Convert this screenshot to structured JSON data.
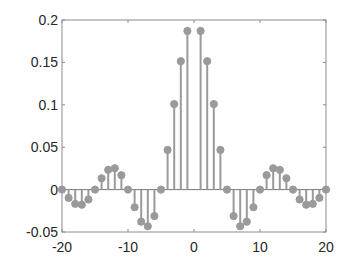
{
  "chart_data": {
    "type": "stem",
    "title": "",
    "xlabel": "",
    "ylabel": "",
    "xlim": [
      -20,
      20
    ],
    "ylim": [
      -0.05,
      0.2
    ],
    "xticks": [
      -20,
      -10,
      0,
      10,
      20
    ],
    "xtick_labels": [
      "-20",
      "-10",
      "0",
      "10",
      "20"
    ],
    "yticks": [
      -0.05,
      0,
      0.05,
      0.1,
      0.15,
      0.2
    ],
    "ytick_labels": [
      "-0.05",
      "0",
      "0.05",
      "0.1",
      "0.15",
      "0.2"
    ],
    "grid": false,
    "legend": null,
    "x": [
      -20,
      -19,
      -18,
      -17,
      -16,
      -15,
      -14,
      -13,
      -12,
      -11,
      -10,
      -9,
      -8,
      -7,
      -6,
      -5,
      -4,
      -3,
      -2,
      -1,
      1,
      2,
      3,
      4,
      5,
      6,
      7,
      8,
      9,
      10,
      11,
      12,
      13,
      14,
      15,
      16,
      17,
      18,
      19,
      20
    ],
    "values": [
      0,
      -0.0098,
      -0.0168,
      -0.0178,
      -0.0117,
      0,
      0.0134,
      0.0233,
      0.0252,
      0.017,
      0,
      -0.0208,
      -0.0378,
      -0.0432,
      -0.0312,
      0,
      0.0468,
      0.1009,
      0.1514,
      0.1871,
      0.1871,
      0.1514,
      0.1009,
      0.0468,
      0,
      -0.0312,
      -0.0432,
      -0.0378,
      -0.0208,
      0,
      0.017,
      0.0252,
      0.0233,
      0.0134,
      0,
      -0.0117,
      -0.0178,
      -0.0168,
      -0.0098,
      0
    ],
    "colors": {
      "stem": "#9a9a9a",
      "marker": "#9a9a9a",
      "axis": "#8c8c8c",
      "text": "#262626"
    }
  }
}
